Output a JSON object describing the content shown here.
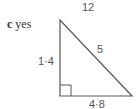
{
  "part": {
    "letter": "c",
    "answer": "yes"
  },
  "labels": {
    "top": "12",
    "left_side": "1·4",
    "hypotenuse": "5",
    "base": "4·8"
  },
  "colors": {
    "line": "#555555",
    "text": "#555555"
  }
}
